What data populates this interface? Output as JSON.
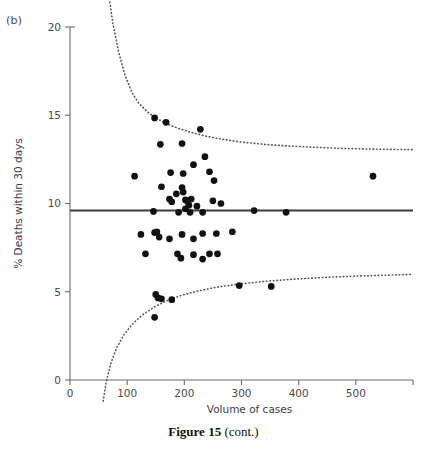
{
  "figure": {
    "panel_label": "(b)",
    "caption_strong": "Figure 15",
    "caption_rest": " (cont.)"
  },
  "chart_data": {
    "type": "scatter",
    "title": "",
    "subtitle": "",
    "xlabel": "Volume of cases",
    "ylabel": "% Deaths within 30 days",
    "xlim": [
      0,
      600
    ],
    "ylim": [
      0,
      20
    ],
    "xticks": [
      0,
      100,
      200,
      300,
      400,
      500
    ],
    "xticklabels": [
      "0",
      "100",
      "200",
      "300",
      "400",
      "500"
    ],
    "yticks": [
      0,
      5,
      10,
      15,
      20
    ],
    "yticklabels": [
      "0",
      "5",
      "10",
      "15",
      "20"
    ],
    "grid": false,
    "legend": "none",
    "marker_color": "#111111",
    "marker_size": 5.2,
    "reference_line": {
      "name": "overall-average",
      "orientation": "horizontal",
      "y": 9.6,
      "style": "solid",
      "color": "#3c3c3c",
      "width": 2.0,
      "x_start": 0,
      "x_end": 600
    },
    "control_limits": [
      {
        "name": "upper-control-limit",
        "style": "dotted",
        "color": "#555555",
        "points": [
          [
            68,
            21.8
          ],
          [
            75,
            20.2
          ],
          [
            85,
            18.6
          ],
          [
            95,
            17.4
          ],
          [
            108,
            16.3
          ],
          [
            120,
            15.7
          ],
          [
            135,
            15.2
          ],
          [
            150,
            14.85
          ],
          [
            170,
            14.5
          ],
          [
            190,
            14.25
          ],
          [
            215,
            14.0
          ],
          [
            240,
            13.8
          ],
          [
            270,
            13.62
          ],
          [
            300,
            13.48
          ],
          [
            340,
            13.35
          ],
          [
            380,
            13.26
          ],
          [
            430,
            13.18
          ],
          [
            480,
            13.12
          ],
          [
            530,
            13.08
          ],
          [
            600,
            13.05
          ]
        ]
      },
      {
        "name": "lower-control-limit",
        "style": "dotted",
        "color": "#555555",
        "points": [
          [
            58,
            -1.2
          ],
          [
            64,
            0.0
          ],
          [
            72,
            1.0
          ],
          [
            82,
            1.85
          ],
          [
            95,
            2.6
          ],
          [
            110,
            3.2
          ],
          [
            128,
            3.72
          ],
          [
            148,
            4.15
          ],
          [
            170,
            4.5
          ],
          [
            195,
            4.8
          ],
          [
            225,
            5.05
          ],
          [
            260,
            5.28
          ],
          [
            300,
            5.45
          ],
          [
            345,
            5.6
          ],
          [
            395,
            5.72
          ],
          [
            450,
            5.82
          ],
          [
            510,
            5.9
          ],
          [
            600,
            5.98
          ]
        ]
      }
    ],
    "points": [
      [
        113,
        11.55
      ],
      [
        148,
        14.85
      ],
      [
        168,
        14.6
      ],
      [
        228,
        14.2
      ],
      [
        158,
        13.35
      ],
      [
        196,
        13.4
      ],
      [
        236,
        12.65
      ],
      [
        216,
        12.2
      ],
      [
        244,
        11.8
      ],
      [
        176,
        11.75
      ],
      [
        198,
        11.7
      ],
      [
        252,
        11.3
      ],
      [
        160,
        10.95
      ],
      [
        196,
        10.9
      ],
      [
        198,
        10.65
      ],
      [
        186,
        10.55
      ],
      [
        174,
        10.25
      ],
      [
        178,
        10.1
      ],
      [
        202,
        10.2
      ],
      [
        206,
        10.1
      ],
      [
        212,
        10.25
      ],
      [
        250,
        10.15
      ],
      [
        264,
        10.0
      ],
      [
        208,
        9.9
      ],
      [
        202,
        9.7
      ],
      [
        222,
        9.85
      ],
      [
        146,
        9.55
      ],
      [
        190,
        9.5
      ],
      [
        210,
        9.5
      ],
      [
        232,
        9.5
      ],
      [
        322,
        9.6
      ],
      [
        378,
        9.5
      ],
      [
        530,
        11.55
      ],
      [
        284,
        8.4
      ],
      [
        124,
        8.25
      ],
      [
        156,
        8.1
      ],
      [
        148,
        8.35
      ],
      [
        152,
        8.4
      ],
      [
        174,
        8.0
      ],
      [
        196,
        8.25
      ],
      [
        232,
        8.3
      ],
      [
        216,
        8.0
      ],
      [
        256,
        8.3
      ],
      [
        132,
        7.15
      ],
      [
        188,
        7.15
      ],
      [
        194,
        6.9
      ],
      [
        216,
        7.1
      ],
      [
        232,
        6.85
      ],
      [
        244,
        7.15
      ],
      [
        258,
        7.15
      ],
      [
        150,
        4.85
      ],
      [
        154,
        4.65
      ],
      [
        160,
        4.6
      ],
      [
        178,
        4.55
      ],
      [
        148,
        3.55
      ],
      [
        296,
        5.35
      ],
      [
        352,
        5.3
      ]
    ]
  }
}
